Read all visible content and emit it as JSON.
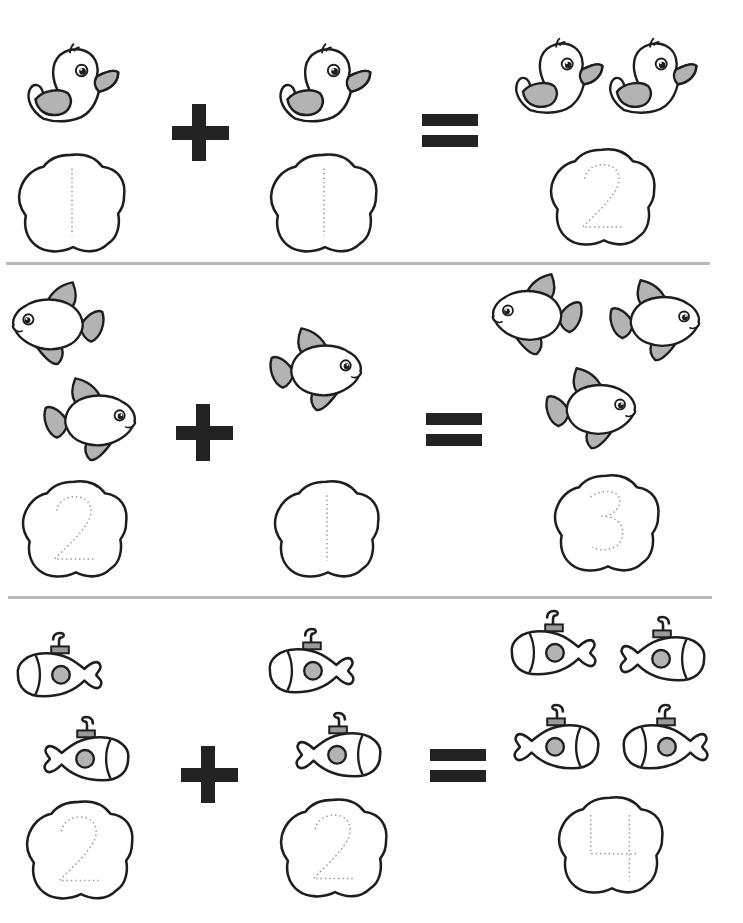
{
  "worksheet": {
    "colors": {
      "ink": "#1e1e1e",
      "fill_gray": "#b3b3b3",
      "divider": "#b9b9b9",
      "trace_dots": "#9a9a9a",
      "operator": "#222222"
    },
    "rows": [
      {
        "object": "duck",
        "addend1": {
          "count": 1,
          "digit": "1"
        },
        "operator1": "+",
        "addend2": {
          "count": 1,
          "digit": "1"
        },
        "operator2": "=",
        "sum": {
          "count": 2,
          "digit": "2"
        },
        "equation": "1 + 1 = 2"
      },
      {
        "object": "fish",
        "addend1": {
          "count": 2,
          "digit": "2"
        },
        "operator1": "+",
        "addend2": {
          "count": 1,
          "digit": "1"
        },
        "operator2": "=",
        "sum": {
          "count": 3,
          "digit": "3"
        },
        "equation": "2 + 1 = 3"
      },
      {
        "object": "submarine",
        "addend1": {
          "count": 2,
          "digit": "2"
        },
        "operator1": "+",
        "addend2": {
          "count": 2,
          "digit": "2"
        },
        "operator2": "=",
        "sum": {
          "count": 4,
          "digit": "4"
        },
        "equation": "2 + 2 = 4"
      }
    ]
  }
}
